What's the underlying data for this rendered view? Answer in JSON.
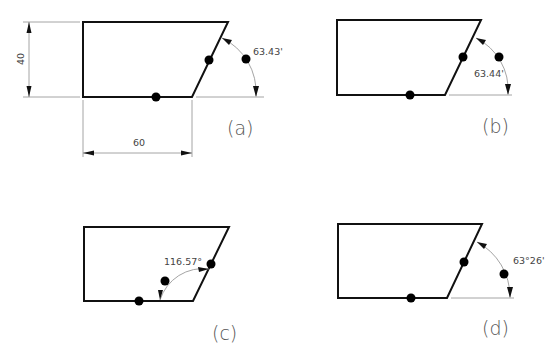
{
  "panels": [
    {
      "id": "a",
      "label": "(a)",
      "angle_label": "63.43'",
      "dimensions": {
        "height_label": "40",
        "width_label": "60"
      }
    },
    {
      "id": "b",
      "label": "(b)",
      "angle_label": "63.44'"
    },
    {
      "id": "c",
      "label": "(c)",
      "angle_label": "116.57°"
    },
    {
      "id": "d",
      "label": "(d)",
      "angle_label": "63°26'"
    }
  ],
  "colors": {
    "outline": "#111111",
    "dimension_lines": "#9a9a9a",
    "markers": "#000000"
  }
}
